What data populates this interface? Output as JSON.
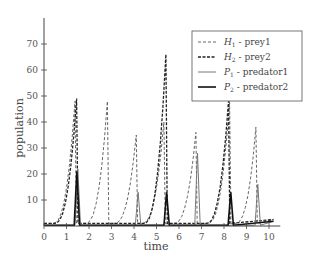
{
  "chart_data": {
    "type": "line",
    "title": "",
    "xlabel": "time",
    "ylabel": "population",
    "xlim": [
      0,
      10.4
    ],
    "ylim": [
      0,
      78
    ],
    "xticks": [
      0,
      1,
      2,
      3,
      4,
      5,
      6,
      7,
      8,
      9,
      10
    ],
    "yticks": [
      10,
      20,
      30,
      40,
      50,
      60,
      70
    ],
    "grid": false,
    "legend_position": "upper right",
    "series": [
      {
        "name": "H1 - prey1",
        "sym": "H",
        "sub": "1",
        "label": " - prey1",
        "style": "dashed-light",
        "peaks": [
          [
            1.38,
            48
          ],
          [
            2.82,
            48
          ],
          [
            4.1,
            35
          ],
          [
            5.33,
            40
          ],
          [
            6.75,
            36
          ],
          [
            8.25,
            48
          ],
          [
            9.42,
            38
          ]
        ],
        "base": 1
      },
      {
        "name": "H2 - prey2",
        "sym": "H",
        "sub": "2",
        "label": " - prey2",
        "style": "dashed-dark",
        "peaks": [
          [
            1.45,
            49
          ],
          [
            5.42,
            66
          ],
          [
            8.2,
            48
          ]
        ],
        "base": 1
      },
      {
        "name": "P1 - predator1",
        "sym": "P",
        "sub": "1",
        "label": " - predator1",
        "style": "solid-light",
        "peaks": [
          [
            1.5,
            22
          ],
          [
            4.18,
            13
          ],
          [
            6.82,
            28
          ],
          [
            9.5,
            16
          ]
        ],
        "base": 0.3
      },
      {
        "name": "P2 - predator2",
        "sym": "P",
        "sub": "2",
        "label": " - predator2",
        "style": "solid-dark",
        "peaks": [
          [
            1.46,
            21
          ],
          [
            5.45,
            13
          ],
          [
            8.3,
            13
          ]
        ],
        "base": 0.3
      }
    ]
  }
}
